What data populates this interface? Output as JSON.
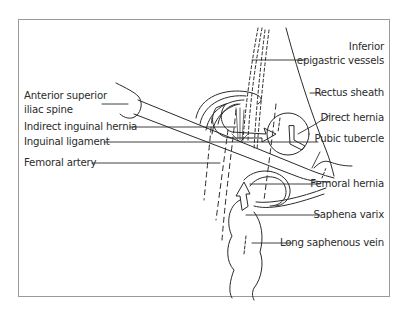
{
  "figure": {
    "labels": {
      "anterior_superior_iliac_spine_line1": "Anterior superior",
      "anterior_superior_iliac_spine_line2": "iliac spine",
      "indirect_inguinal_hernia": "Indirect inguinal hernia",
      "inguinal_ligament": "Inguinal ligament",
      "femoral_artery": "Femoral artery",
      "inferior_epigastric_vessels_line1": "Inferior",
      "inferior_epigastric_vessels_line2": "epigastric vessels",
      "rectus_sheath": "Rectus sheath",
      "direct_hernia": "Direct hernia",
      "pubic_tubercle": "Pubic tubercle",
      "femoral_hernia": "Femoral hernia",
      "saphena_varix": "Saphena varix",
      "long_saphenous_vein": "Long saphenous vein"
    },
    "colors": {
      "line": "#2a2a2a",
      "frame": "#9a9a9a",
      "background": "#ffffff"
    }
  }
}
